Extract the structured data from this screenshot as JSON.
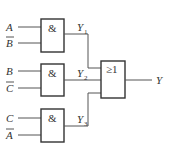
{
  "diagram": {
    "type": "logic-circuit",
    "gates": [
      {
        "id": "and1",
        "symbol": "&",
        "inputs": [
          {
            "name": "A",
            "negated": false
          },
          {
            "name": "B",
            "negated": true
          }
        ],
        "output": {
          "name": "Y",
          "sub": "1"
        }
      },
      {
        "id": "and2",
        "symbol": "&",
        "inputs": [
          {
            "name": "B",
            "negated": false
          },
          {
            "name": "C",
            "negated": true
          }
        ],
        "output": {
          "name": "Y",
          "sub": "2"
        }
      },
      {
        "id": "and3",
        "symbol": "&",
        "inputs": [
          {
            "name": "C",
            "negated": false
          },
          {
            "name": "A",
            "negated": true
          }
        ],
        "output": {
          "name": "Y",
          "sub": "3"
        }
      },
      {
        "id": "or1",
        "symbol": "≥1",
        "inputs": [
          "Y1",
          "Y2",
          "Y3"
        ],
        "output": {
          "name": "Y"
        }
      }
    ]
  }
}
